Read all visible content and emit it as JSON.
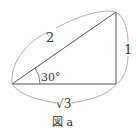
{
  "figure": {
    "caption": "図 a",
    "type": "right-triangle",
    "labels": {
      "hypotenuse": "2",
      "vertical_side": "1",
      "base": "√3",
      "angle": "30°"
    },
    "colors": {
      "line": "#555555",
      "brace": "#9a9a9a",
      "text": "#333333"
    }
  }
}
